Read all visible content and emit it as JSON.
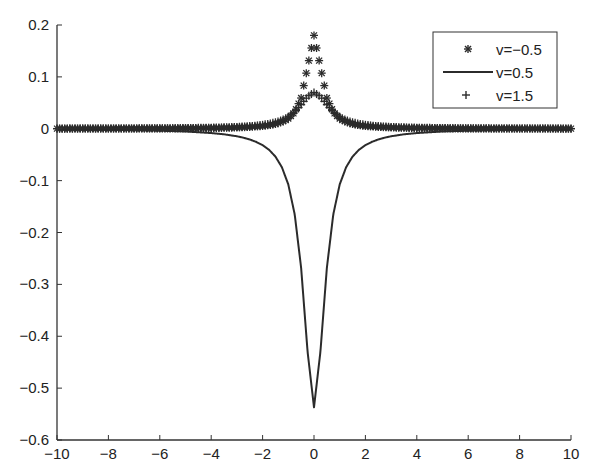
{
  "chart_data": {
    "type": "line",
    "title": "",
    "xlabel": "",
    "ylabel": "",
    "xlim": [
      -10,
      10
    ],
    "ylim": [
      -0.6,
      0.2
    ],
    "grid": false,
    "legend_position": "upper right",
    "x_ticks": [
      -10,
      -8,
      -6,
      -4,
      -2,
      0,
      2,
      4,
      6,
      8,
      10
    ],
    "x_tick_labels": [
      "−10",
      "−8",
      "−6",
      "−4",
      "−2",
      "0",
      "2",
      "4",
      "6",
      "8",
      "10"
    ],
    "y_ticks": [
      0.2,
      0.1,
      0,
      -0.1,
      -0.2,
      -0.3,
      -0.4,
      -0.5,
      -0.6
    ],
    "y_tick_labels": [
      "0.2",
      "0.1",
      "0",
      "−0.1",
      "−0.2",
      "−0.3",
      "−0.4",
      "−0.5",
      "−0.6"
    ],
    "x": [
      -10,
      -9,
      -8,
      -7,
      -6,
      -5,
      -4,
      -3.5,
      -3,
      -2.75,
      -2.5,
      -2.25,
      -2,
      -1.75,
      -1.5,
      -1.25,
      -1,
      -0.75,
      -0.5,
      -0.25,
      0,
      0.25,
      0.5,
      0.75,
      1,
      1.25,
      1.5,
      1.75,
      2,
      2.25,
      2.5,
      2.75,
      3,
      3.5,
      4,
      5,
      6,
      7,
      8,
      9,
      10
    ],
    "series": [
      {
        "name": "v=−0.5",
        "marker": "asterisk",
        "line": "none",
        "values": [
          0.0002,
          0.0003,
          0.0003,
          0.0004,
          0.0006,
          0.0009,
          0.0014,
          0.0018,
          0.0024,
          0.0029,
          0.0035,
          0.0043,
          0.0053,
          0.0069,
          0.0093,
          0.0131,
          0.0196,
          0.0322,
          0.0592,
          0.1192,
          0.18,
          0.1192,
          0.0592,
          0.0322,
          0.0196,
          0.0131,
          0.0093,
          0.0069,
          0.0053,
          0.0043,
          0.0035,
          0.0029,
          0.0024,
          0.0018,
          0.0014,
          0.0009,
          0.0006,
          0.0004,
          0.0003,
          0.0003,
          0.0002
        ]
      },
      {
        "name": "v=0.5",
        "marker": "none",
        "line": "solid",
        "values": [
          -0.0013,
          -0.0017,
          -0.0021,
          -0.0027,
          -0.0037,
          -0.0053,
          -0.0083,
          -0.0107,
          -0.0145,
          -0.0172,
          -0.0207,
          -0.0253,
          -0.0316,
          -0.0405,
          -0.0537,
          -0.0741,
          -0.1074,
          -0.1652,
          -0.2685,
          -0.4296,
          -0.537,
          -0.4296,
          -0.2685,
          -0.1652,
          -0.1074,
          -0.0741,
          -0.0537,
          -0.0405,
          -0.0316,
          -0.0253,
          -0.0207,
          -0.0172,
          -0.0145,
          -0.0107,
          -0.0083,
          -0.0053,
          -0.0037,
          -0.0027,
          -0.0021,
          -0.0017,
          -0.0013
        ]
      },
      {
        "name": "v=1.5",
        "marker": "plus",
        "line": "none",
        "values": [
          0.0003,
          0.0004,
          0.0005,
          0.0007,
          0.0009,
          0.0013,
          0.0021,
          0.0027,
          0.0036,
          0.0043,
          0.0051,
          0.0062,
          0.0076,
          0.0097,
          0.0125,
          0.0167,
          0.023,
          0.0326,
          0.0464,
          0.0621,
          0.07,
          0.0621,
          0.0464,
          0.0326,
          0.023,
          0.0167,
          0.0125,
          0.0097,
          0.0076,
          0.0062,
          0.0051,
          0.0043,
          0.0036,
          0.0027,
          0.0021,
          0.0013,
          0.0009,
          0.0007,
          0.0005,
          0.0004,
          0.0003
        ]
      }
    ],
    "marker_spacing_x": 0.1
  },
  "legend": {
    "items": [
      {
        "label": "v=−0.5",
        "symbol": "asterisk"
      },
      {
        "label": "v=0.5",
        "symbol": "solid-line"
      },
      {
        "label": "v=1.5",
        "symbol": "plus"
      }
    ]
  },
  "colors": {
    "line": "#2b2b2b",
    "axis": "#333333",
    "text": "#222222",
    "background": "#ffffff"
  }
}
